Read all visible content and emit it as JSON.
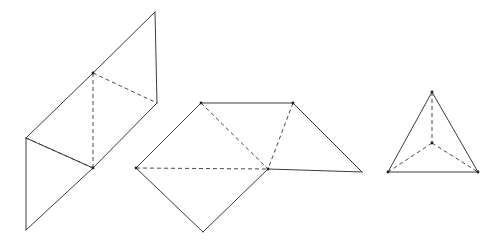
{
  "figure": {
    "background_color": "#ffffff",
    "solid_stroke_color": "#3a3a3a",
    "hidden_stroke_color": "#4a4a4a",
    "stroke_width": 1,
    "hidden_dash_pattern": "4 3",
    "canvas": {
      "width": 504,
      "height": 245
    },
    "shapes": [
      {
        "id": "left-shape",
        "name": "tetrahedron-net-parallelogram",
        "label": "",
        "vertices": {
          "top_apex": [
            93,
            73
          ],
          "top_right": [
            155,
            12
          ],
          "right": [
            157,
            103
          ],
          "left": [
            26,
            138
          ],
          "bottom_left": [
            26,
            230
          ],
          "center_bottom": [
            93,
            168
          ]
        },
        "solid_edges": [
          [
            [
              26,
              138
            ],
            [
              93,
              73
            ]
          ],
          [
            [
              93,
              73
            ],
            [
              155,
              12
            ]
          ],
          [
            [
              155,
              12
            ],
            [
              157,
              103
            ]
          ],
          [
            [
              157,
              103
            ],
            [
              93,
              168
            ]
          ],
          [
            [
              93,
              168
            ],
            [
              26,
              138
            ]
          ],
          [
            [
              26,
              138
            ],
            [
              26,
              230
            ]
          ],
          [
            [
              26,
              230
            ],
            [
              93,
              168
            ]
          ]
        ],
        "hidden_edges": [
          [
            [
              93,
              73
            ],
            [
              93,
              168
            ]
          ],
          [
            [
              93,
              73
            ],
            [
              157,
              103
            ]
          ],
          [
            [
              26,
              138
            ],
            [
              93,
              168
            ]
          ]
        ],
        "vertex_dots": [
          [
            93,
            73
          ],
          [
            93,
            168
          ]
        ]
      },
      {
        "id": "middle-shape",
        "name": "tetrahedron-net-diamond",
        "label": "",
        "vertices": {
          "top_left": [
            201,
            103
          ],
          "top_right": [
            293,
            103
          ],
          "left": [
            136,
            168
          ],
          "center": [
            268,
            169
          ],
          "right": [
            362,
            172
          ],
          "bottom": [
            203,
            232
          ]
        },
        "solid_edges": [
          [
            [
              201,
              103
            ],
            [
              293,
              103
            ]
          ],
          [
            [
              201,
              103
            ],
            [
              136,
              168
            ]
          ],
          [
            [
              136,
              168
            ],
            [
              203,
              232
            ]
          ],
          [
            [
              203,
              232
            ],
            [
              268,
              169
            ]
          ],
          [
            [
              268,
              169
            ],
            [
              362,
              172
            ]
          ],
          [
            [
              362,
              172
            ],
            [
              293,
              103
            ]
          ]
        ],
        "hidden_edges": [
          [
            [
              201,
              103
            ],
            [
              268,
              169
            ]
          ],
          [
            [
              136,
              168
            ],
            [
              268,
              169
            ]
          ],
          [
            [
              293,
              103
            ],
            [
              268,
              169
            ]
          ]
        ],
        "vertex_dots": [
          [
            201,
            103
          ],
          [
            293,
            103
          ],
          [
            268,
            169
          ],
          [
            136,
            168
          ]
        ]
      },
      {
        "id": "right-shape",
        "name": "tetrahedron-triangle",
        "label": "",
        "vertices": {
          "apex": [
            432,
            92
          ],
          "bottom_left": [
            388,
            172
          ],
          "bottom_right": [
            478,
            172
          ],
          "center": [
            432,
            143
          ]
        },
        "solid_edges": [
          [
            [
              432,
              92
            ],
            [
              388,
              172
            ]
          ],
          [
            [
              432,
              92
            ],
            [
              478,
              172
            ]
          ],
          [
            [
              388,
              172
            ],
            [
              478,
              172
            ]
          ]
        ],
        "hidden_edges": [
          [
            [
              432,
              92
            ],
            [
              432,
              143
            ]
          ],
          [
            [
              432,
              143
            ],
            [
              388,
              172
            ]
          ],
          [
            [
              432,
              143
            ],
            [
              478,
              172
            ]
          ]
        ],
        "vertex_dots": [
          [
            432,
            92
          ],
          [
            388,
            172
          ],
          [
            478,
            172
          ],
          [
            432,
            143
          ]
        ]
      }
    ]
  }
}
